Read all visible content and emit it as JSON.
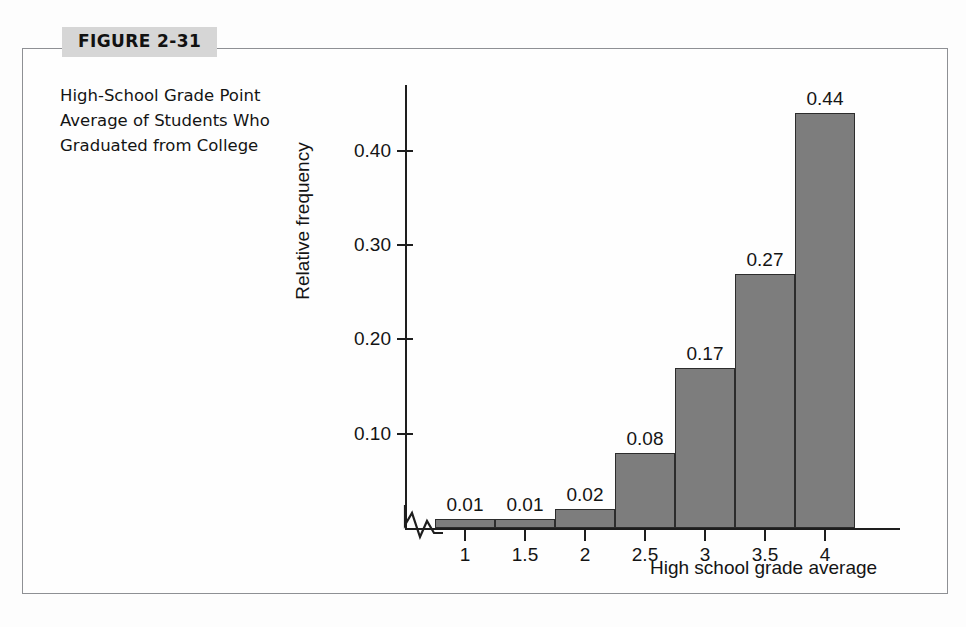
{
  "figure": {
    "tag_label": "FIGURE 2-31",
    "caption": "High-School Grade Point Average of Students Who Graduated from College"
  },
  "colors": {
    "bar_fill": "#7d7d7d",
    "bar_stroke": "#2c2c2c",
    "axis": "#1e1e1e",
    "frame": "#8e9094",
    "tag_background": "#d6d6d6",
    "page_background": "#fefefe"
  },
  "chart_data": {
    "type": "bar",
    "title": "High-School Grade Point Average of Students Who Graduated from College",
    "xlabel": "High school grade average",
    "ylabel": "Relative frequency",
    "categories": [
      "1",
      "1.5",
      "2",
      "2.5",
      "3",
      "3.5",
      "4"
    ],
    "values": [
      0.01,
      0.01,
      0.02,
      0.08,
      0.17,
      0.27,
      0.44
    ],
    "value_labels": [
      "0.01",
      "0.01",
      "0.02",
      "0.08",
      "0.17",
      "0.27",
      "0.44"
    ],
    "ylim": [
      0,
      0.47
    ],
    "yticks": [
      0.1,
      0.2,
      0.3,
      0.4
    ],
    "ytick_labels": [
      "0.10",
      "0.20",
      "0.30",
      "0.40"
    ],
    "xtick_labels": [
      "1",
      "1.5",
      "2",
      "2.5",
      "3",
      "3.5",
      "4"
    ],
    "grid": false,
    "legend": false,
    "axis_break": true,
    "axis_break_note": "zigzag break on horizontal axis near origin"
  }
}
